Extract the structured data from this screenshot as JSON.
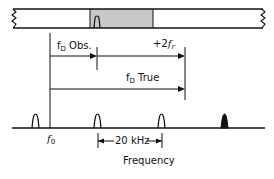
{
  "diagram": {
    "type": "doppler-frequency-ambiguity",
    "colors": {
      "line": "#111111",
      "shaded_band": "#c8c8c8",
      "background": "#ffffff"
    },
    "labels": {
      "fd_obs_main": "f",
      "fd_obs_sub": "D",
      "fd_obs_suffix": " Obs.",
      "two_fr_prefix": "+2",
      "two_fr_main": "f",
      "two_fr_sub": "r",
      "fd_true_main": "f",
      "fd_true_sub": "D",
      "fd_true_suffix": " True",
      "f0_main": "f",
      "f0_sub": "0",
      "spacing": "20 kHz",
      "axis": "Frequency"
    },
    "spectral_lines": [
      {
        "position": "left of f0",
        "style": "outline"
      },
      {
        "position": "observed",
        "style": "outline"
      },
      {
        "position": "observed+20kHz",
        "style": "outline"
      },
      {
        "position": "true doppler",
        "style": "filled"
      }
    ]
  }
}
